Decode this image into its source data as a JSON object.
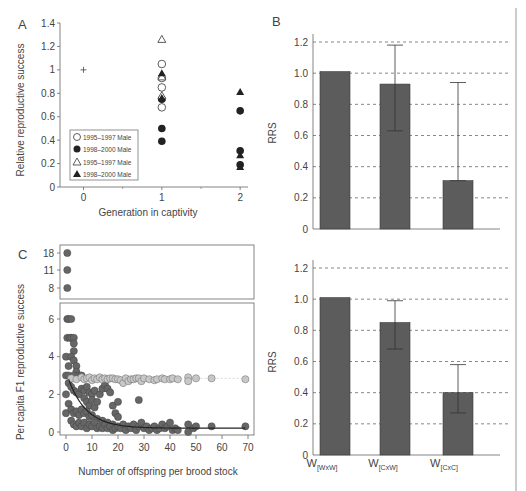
{
  "chart_data": [
    {
      "panel": "A",
      "type": "scatter",
      "xlabel": "Generation in captivity",
      "ylabel": "Relative reproductive success",
      "xticks": [
        "0",
        "1",
        "2"
      ],
      "yticks": [
        "0",
        "0.2",
        "0.4",
        "0.6",
        "0.8",
        "1",
        "1.2",
        "1.4"
      ],
      "xlim": [
        -0.3,
        2.1
      ],
      "ylim": [
        0,
        1.4
      ],
      "legend": [
        {
          "label": "1995–1997 Male",
          "marker": "circle-open"
        },
        {
          "label": "1998–2000 Male",
          "marker": "circle-filled"
        },
        {
          "label": "1995–1997 Male",
          "marker": "triangle-open"
        },
        {
          "label": "1998–2000 Male",
          "marker": "triangle-filled"
        }
      ],
      "series": [
        {
          "name": "reference",
          "marker": "plus",
          "points": [
            [
              0,
              1.0
            ]
          ]
        },
        {
          "name": "1995–1997 Male (circle)",
          "marker": "circle-open",
          "points": [
            [
              1,
              1.05
            ],
            [
              1,
              0.85
            ],
            [
              1,
              0.68
            ],
            [
              1,
              0.93
            ]
          ]
        },
        {
          "name": "1998–2000 Male (circle)",
          "marker": "circle-filled",
          "points": [
            [
              1,
              0.75
            ],
            [
              1,
              0.5
            ],
            [
              1,
              0.39
            ],
            [
              2,
              0.65
            ],
            [
              2,
              0.31
            ],
            [
              2,
              0.19
            ]
          ]
        },
        {
          "name": "1995–1997 Male (triangle)",
          "marker": "triangle-open",
          "points": [
            [
              1,
              1.26
            ],
            [
              1,
              0.94
            ],
            [
              1,
              0.78
            ]
          ]
        },
        {
          "name": "1998–2000 Male (triangle)",
          "marker": "triangle-filled",
          "points": [
            [
              1,
              0.97
            ],
            [
              1,
              0.76
            ],
            [
              2,
              0.81
            ],
            [
              2,
              0.27
            ],
            [
              2,
              0.17
            ]
          ]
        }
      ]
    },
    {
      "panel": "B-top",
      "type": "bar",
      "ylabel": "RRS",
      "categories": [
        "W[WxW]",
        "W[CxW]",
        "W[CxC]"
      ],
      "values": [
        1.01,
        0.93,
        0.31
      ],
      "error_low": [
        null,
        0.63,
        0.31
      ],
      "error_high": [
        null,
        1.18,
        0.94
      ],
      "yticks": [
        "0",
        "0.2",
        "0.4",
        "0.6",
        "0.8",
        "1.0",
        "1.2"
      ],
      "ylim": [
        0,
        1.2
      ],
      "grid": "dashed horizontal"
    },
    {
      "panel": "B-bottom",
      "type": "bar",
      "ylabel": "RRS",
      "categories": [
        "W[WxW]",
        "W[CxW]",
        "W[CxC]"
      ],
      "values": [
        1.01,
        0.85,
        0.4
      ],
      "error_low": [
        null,
        0.68,
        0.27
      ],
      "error_high": [
        null,
        0.99,
        0.58
      ],
      "yticks": [
        "0",
        "0.2",
        "0.4",
        "0.6",
        "0.8",
        "1.0",
        "1.2"
      ],
      "ylim": [
        0,
        1.2
      ],
      "grid": "dashed horizontal"
    },
    {
      "panel": "C",
      "type": "scatter",
      "xlabel": "Number of offspring per brood stock",
      "ylabel": "Per capita F1 reproductive success",
      "xticks": [
        "0",
        "10",
        "20",
        "30",
        "40",
        "50",
        "60",
        "70"
      ],
      "yticks_lower": [
        "0",
        "2",
        "4",
        "6"
      ],
      "yticks_upper": [
        "8",
        "11",
        "18"
      ],
      "xlim": [
        -2,
        71
      ],
      "ylim_lower": [
        -0.3,
        6.5
      ],
      "series": [
        {
          "name": "outliers (broken axis)",
          "color": "#666666",
          "points": [
            [
              0.5,
              18
            ],
            [
              0.5,
              11
            ],
            [
              0.5,
              8
            ]
          ]
        },
        {
          "name": "light points",
          "color": "#c8c8c8",
          "points": [
            [
              2,
              2.85
            ],
            [
              4,
              2.8
            ],
            [
              6,
              2.9
            ],
            [
              7,
              2.8
            ],
            [
              8,
              2.85
            ],
            [
              9,
              2.9
            ],
            [
              10,
              2.75
            ],
            [
              11,
              2.85
            ],
            [
              12,
              2.8
            ],
            [
              13,
              2.9
            ],
            [
              14,
              2.8
            ],
            [
              15,
              2.85
            ],
            [
              16,
              2.8
            ],
            [
              17,
              2.85
            ],
            [
              18,
              2.85
            ],
            [
              19,
              2.8
            ],
            [
              20,
              2.8
            ],
            [
              21,
              2.75
            ],
            [
              22,
              2.6
            ],
            [
              23,
              2.85
            ],
            [
              24,
              2.7
            ],
            [
              25,
              2.8
            ],
            [
              26,
              2.8
            ],
            [
              27,
              2.85
            ],
            [
              28,
              2.85
            ],
            [
              29,
              2.7
            ],
            [
              30,
              2.85
            ],
            [
              32,
              2.8
            ],
            [
              34,
              2.75
            ],
            [
              35,
              2.8
            ],
            [
              37,
              2.85
            ],
            [
              38,
              2.8
            ],
            [
              40,
              2.8
            ],
            [
              41,
              2.85
            ],
            [
              43,
              2.8
            ],
            [
              47,
              2.9
            ],
            [
              47,
              2.7
            ],
            [
              50,
              2.85
            ],
            [
              56,
              2.85
            ],
            [
              69,
              2.8
            ]
          ]
        },
        {
          "name": "dark points",
          "color": "#666666",
          "points": [
            [
              0.5,
              6
            ],
            [
              1,
              6
            ],
            [
              2,
              6
            ],
            [
              0.5,
              5
            ],
            [
              1.5,
              5
            ],
            [
              2,
              5
            ],
            [
              3,
              5
            ],
            [
              3,
              4.7
            ],
            [
              3,
              4.3
            ],
            [
              0,
              4
            ],
            [
              2,
              4
            ],
            [
              3,
              3.8
            ],
            [
              4,
              3.5
            ],
            [
              4,
              3.2
            ],
            [
              1,
              3.5
            ],
            [
              0,
              3
            ],
            [
              1,
              3
            ],
            [
              3,
              3
            ],
            [
              5,
              3
            ],
            [
              6,
              3
            ],
            [
              0,
              2
            ],
            [
              1,
              2.6
            ],
            [
              2,
              2.4
            ],
            [
              3,
              2.2
            ],
            [
              4,
              2.1
            ],
            [
              5,
              2.0
            ],
            [
              6,
              2.3
            ],
            [
              7,
              2.2
            ],
            [
              8,
              2.4
            ],
            [
              9,
              2.1
            ],
            [
              10,
              2.0
            ],
            [
              11,
              2.2
            ],
            [
              7,
              1.8
            ],
            [
              8,
              1.6
            ],
            [
              9,
              1.4
            ],
            [
              10,
              1.7
            ],
            [
              11,
              1.3
            ],
            [
              12,
              1.6
            ],
            [
              13,
              2.0
            ],
            [
              14,
              2.3
            ],
            [
              15,
              2.5
            ],
            [
              16,
              2.3
            ],
            [
              17,
              2.1
            ],
            [
              18,
              1.4
            ],
            [
              19,
              1.0
            ],
            [
              20,
              1.6
            ],
            [
              20,
              0.8
            ],
            [
              28,
              1.7
            ],
            [
              0,
              1
            ],
            [
              1,
              1.5
            ],
            [
              2,
              1.2
            ],
            [
              3,
              1.0
            ],
            [
              4,
              1.1
            ],
            [
              5,
              0.9
            ],
            [
              6,
              1.2
            ],
            [
              7,
              1.0
            ],
            [
              8,
              1.1
            ],
            [
              9,
              0.8
            ],
            [
              10,
              0.9
            ],
            [
              12,
              0.7
            ],
            [
              14,
              0.6
            ],
            [
              16,
              0.5
            ],
            [
              18,
              0.4
            ],
            [
              2,
              0.6
            ],
            [
              3,
              0.4
            ],
            [
              4,
              0.3
            ],
            [
              5,
              0.5
            ],
            [
              6,
              0.3
            ],
            [
              7,
              0.5
            ],
            [
              8,
              0.2
            ],
            [
              9,
              0.4
            ],
            [
              10,
              0.3
            ],
            [
              11,
              0.5
            ],
            [
              12,
              0.2
            ],
            [
              13,
              0.3
            ],
            [
              14,
              0.2
            ],
            [
              15,
              0.4
            ],
            [
              16,
              0.2
            ],
            [
              17,
              0.3
            ],
            [
              18,
              0.1
            ],
            [
              19,
              0.2
            ],
            [
              20,
              0.3
            ],
            [
              21,
              0.2
            ],
            [
              22,
              0.4
            ],
            [
              23,
              0.1
            ],
            [
              24,
              0.3
            ],
            [
              25,
              0.2
            ],
            [
              26,
              0.4
            ],
            [
              27,
              0.1
            ],
            [
              28,
              0.3
            ],
            [
              29,
              0.5
            ],
            [
              30,
              0.2
            ],
            [
              31,
              0.3
            ],
            [
              32,
              0.1
            ],
            [
              33,
              0.2
            ],
            [
              34,
              0.3
            ],
            [
              35,
              0.1
            ],
            [
              36,
              0.2
            ],
            [
              37,
              0.4
            ],
            [
              38,
              0.2
            ],
            [
              39,
              0.3
            ],
            [
              40,
              0.5
            ],
            [
              41,
              0.1
            ],
            [
              42,
              0.2
            ],
            [
              43,
              0.1
            ],
            [
              47,
              0.4
            ],
            [
              47,
              0.0
            ],
            [
              49,
              0.2
            ],
            [
              50,
              0.3
            ],
            [
              56,
              0.3
            ],
            [
              69,
              0.3
            ]
          ]
        }
      ],
      "fit_line": "decreasing curve from (1, 2.8) to (69, 0.2)"
    }
  ],
  "panels": {
    "a": {
      "label": "A",
      "xlabel": "Generation in captivity",
      "ylabel": "Relative reproductive success",
      "yticks": [
        "0",
        "0.2",
        "0.4",
        "0.6",
        "0.8",
        "1",
        "1.2",
        "1.4"
      ],
      "xticks": [
        "0",
        "1",
        "2"
      ],
      "legend": [
        "1995–1997 Male",
        "1998–2000 Male",
        "1995–1997 Male",
        "1998–2000 Male"
      ]
    },
    "b": {
      "label": "B",
      "ylabel": "RRS",
      "yticks": [
        "0",
        "0.2",
        "0.4",
        "0.6",
        "0.8",
        "1.0",
        "1.2"
      ],
      "categories": [
        {
          "main": "W",
          "sub": "[WxW]"
        },
        {
          "main": "W",
          "sub": "[CxW]"
        },
        {
          "main": "W",
          "sub": "[CxC]"
        }
      ]
    },
    "c": {
      "label": "C",
      "xlabel": "Number of offspring per brood stock",
      "ylabel": "Per capita F1 reproductive success",
      "xticks": [
        "0",
        "10",
        "20",
        "30",
        "40",
        "50",
        "60",
        "70"
      ],
      "yticks_lower": [
        "0",
        "2",
        "4",
        "6"
      ],
      "yticks_upper": [
        "8",
        "11",
        "18"
      ]
    }
  },
  "colors": {
    "bar": "#5c5c5c",
    "dark_point": "#666666",
    "light_point": "#c8c8c8",
    "axis": "#666666",
    "grid": "#555555"
  }
}
